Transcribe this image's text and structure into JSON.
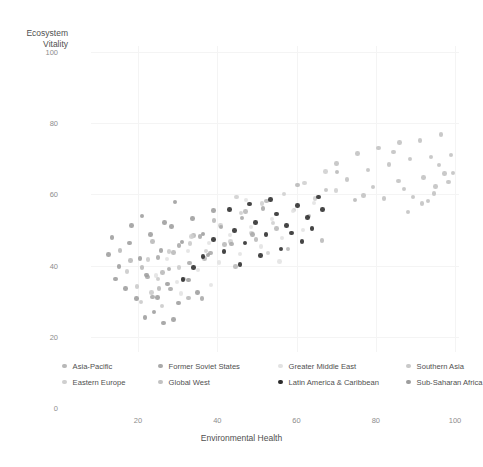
{
  "chart_data": {
    "type": "scatter",
    "title": "",
    "xlabel": "Environmental Health",
    "ylabel": "Ecosystem\nVitality",
    "ylabel_line1": "Ecosystem",
    "ylabel_line2": "Vitality",
    "xlim": [
      0,
      100
    ],
    "ylim": [
      0,
      100
    ],
    "xticks": [
      20,
      40,
      60,
      80,
      100
    ],
    "yticks": [
      0,
      20,
      40,
      60,
      80,
      100
    ],
    "grid": true,
    "legend_position": "bottom",
    "series": [
      {
        "name": "Asia-Pacific",
        "color": "#b8b8b8",
        "points": [
          [
            15.4,
            44.2
          ],
          [
            18.1,
            41.5
          ],
          [
            21.0,
            39.4
          ],
          [
            23.6,
            46.8
          ],
          [
            26.2,
            38.1
          ],
          [
            28.9,
            43.7
          ],
          [
            31.5,
            36.2
          ],
          [
            34.0,
            48.5
          ],
          [
            36.8,
            42.0
          ],
          [
            39.2,
            52.6
          ],
          [
            41.8,
            45.9
          ],
          [
            44.6,
            39.8
          ],
          [
            47.1,
            55.2
          ],
          [
            49.8,
            47.3
          ],
          [
            52.4,
            58.1
          ],
          [
            55.0,
            50.4
          ],
          [
            57.8,
            44.6
          ],
          [
            60.3,
            62.7
          ],
          [
            63.1,
            53.9
          ],
          [
            66.4,
            47.1
          ],
          [
            70.2,
            66.3
          ],
          [
            74.8,
            58.4
          ],
          [
            25.3,
            33.6
          ],
          [
            32.7,
            30.9
          ]
        ]
      },
      {
        "name": "Eastern Europe",
        "color": "#cfcfcf",
        "points": [
          [
            33.5,
            48.2
          ],
          [
            37.2,
            44.1
          ],
          [
            40.8,
            51.3
          ],
          [
            43.4,
            46.7
          ],
          [
            46.0,
            54.8
          ],
          [
            48.7,
            49.2
          ],
          [
            51.3,
            57.4
          ],
          [
            54.1,
            52.0
          ],
          [
            56.8,
            60.1
          ],
          [
            59.4,
            55.6
          ],
          [
            62.0,
            63.2
          ],
          [
            64.7,
            58.9
          ],
          [
            67.3,
            66.4
          ],
          [
            70.0,
            61.1
          ],
          [
            44.9,
            59.3
          ],
          [
            52.8,
            43.5
          ]
        ]
      },
      {
        "name": "Former Soviet States",
        "color": "#a9a9a9",
        "points": [
          [
            22.4,
            36.8
          ],
          [
            25.1,
            42.3
          ],
          [
            27.8,
            39.1
          ],
          [
            30.4,
            45.6
          ],
          [
            33.0,
            40.8
          ],
          [
            35.7,
            48.2
          ],
          [
            38.3,
            43.5
          ],
          [
            41.0,
            50.9
          ],
          [
            43.6,
            46.1
          ],
          [
            46.3,
            53.4
          ],
          [
            48.9,
            48.7
          ],
          [
            51.5,
            56.0
          ],
          [
            28.2,
            33.4
          ],
          [
            36.1,
            30.7
          ],
          [
            23.7,
            31.2
          ]
        ]
      },
      {
        "name": "Global West",
        "color": "#c2c2c2",
        "points": [
          [
            67.4,
            61.3
          ],
          [
            70.1,
            68.7
          ],
          [
            72.8,
            64.2
          ],
          [
            75.4,
            71.5
          ],
          [
            78.0,
            66.8
          ],
          [
            80.7,
            73.1
          ],
          [
            83.3,
            68.4
          ],
          [
            86.0,
            74.6
          ],
          [
            88.6,
            69.9
          ],
          [
            91.2,
            75.2
          ],
          [
            93.9,
            70.5
          ],
          [
            96.5,
            76.8
          ],
          [
            99.0,
            71.1
          ],
          [
            82.1,
            58.9
          ],
          [
            85.8,
            63.7
          ],
          [
            89.4,
            59.2
          ],
          [
            92.0,
            64.8
          ],
          [
            94.7,
            60.3
          ],
          [
            97.3,
            65.9
          ],
          [
            88.2,
            55.1
          ],
          [
            91.7,
            57.4
          ],
          [
            95.1,
            62.2
          ],
          [
            98.4,
            63.5
          ],
          [
            79.3,
            62.1
          ],
          [
            76.9,
            59.7
          ],
          [
            84.5,
            71.9
          ],
          [
            87.1,
            61.5
          ],
          [
            93.2,
            58.1
          ],
          [
            96.0,
            68.3
          ],
          [
            99.5,
            66.0
          ]
        ]
      },
      {
        "name": "Greater Middle East",
        "color": "#e2e2e2",
        "points": [
          [
            24.6,
            37.2
          ],
          [
            27.3,
            41.8
          ],
          [
            29.9,
            35.4
          ],
          [
            32.6,
            44.1
          ],
          [
            35.2,
            38.7
          ],
          [
            37.9,
            46.3
          ],
          [
            40.5,
            40.9
          ],
          [
            43.2,
            48.6
          ],
          [
            45.8,
            43.2
          ],
          [
            48.5,
            50.8
          ],
          [
            51.1,
            45.4
          ],
          [
            53.8,
            53.1
          ],
          [
            56.4,
            47.7
          ],
          [
            59.1,
            55.3
          ],
          [
            61.7,
            50.0
          ],
          [
            64.4,
            57.6
          ],
          [
            30.8,
            32.1
          ],
          [
            38.4,
            34.5
          ],
          [
            47.2,
            58.4
          ],
          [
            55.7,
            41.2
          ]
        ]
      },
      {
        "name": "Latin America & Caribbean",
        "color": "#2b2b2b",
        "points": [
          [
            36.4,
            42.6
          ],
          [
            39.0,
            47.3
          ],
          [
            41.7,
            44.0
          ],
          [
            44.3,
            49.8
          ],
          [
            47.0,
            46.4
          ],
          [
            49.6,
            52.1
          ],
          [
            52.3,
            48.8
          ],
          [
            54.9,
            54.5
          ],
          [
            57.5,
            51.2
          ],
          [
            60.2,
            56.9
          ],
          [
            62.8,
            53.5
          ],
          [
            65.5,
            59.2
          ],
          [
            43.1,
            55.7
          ],
          [
            45.7,
            40.3
          ],
          [
            50.9,
            42.9
          ],
          [
            56.1,
            44.6
          ],
          [
            58.7,
            49.2
          ],
          [
            61.4,
            46.8
          ],
          [
            34.0,
            39.5
          ],
          [
            31.3,
            36.1
          ],
          [
            63.9,
            50.4
          ],
          [
            66.6,
            55.8
          ],
          [
            48.2,
            57.3
          ],
          [
            53.4,
            58.6
          ]
        ]
      },
      {
        "name": "Southern Asia",
        "color": "#c9c9c9",
        "points": [
          [
            17.2,
            38.4
          ],
          [
            19.8,
            34.1
          ],
          [
            22.5,
            41.7
          ],
          [
            25.1,
            36.3
          ],
          [
            27.8,
            43.9
          ],
          [
            30.4,
            39.5
          ],
          [
            33.1,
            46.2
          ],
          [
            20.7,
            29.8
          ],
          [
            23.4,
            32.5
          ],
          [
            26.0,
            28.7
          ]
        ]
      },
      {
        "name": "Sub-Saharan Africa",
        "color": "#9d9d9d",
        "points": [
          [
            12.6,
            43.1
          ],
          [
            15.2,
            39.8
          ],
          [
            17.9,
            46.4
          ],
          [
            20.5,
            42.0
          ],
          [
            23.2,
            48.7
          ],
          [
            25.8,
            44.3
          ],
          [
            28.5,
            51.0
          ],
          [
            31.1,
            46.6
          ],
          [
            33.8,
            53.2
          ],
          [
            36.4,
            48.9
          ],
          [
            39.1,
            55.5
          ],
          [
            14.3,
            36.2
          ],
          [
            16.9,
            33.5
          ],
          [
            19.6,
            30.8
          ],
          [
            22.2,
            37.4
          ],
          [
            24.9,
            31.1
          ],
          [
            27.5,
            34.8
          ],
          [
            30.2,
            29.5
          ],
          [
            32.8,
            36.0
          ],
          [
            18.4,
            51.3
          ],
          [
            21.0,
            54.0
          ],
          [
            26.7,
            52.1
          ],
          [
            29.3,
            57.8
          ],
          [
            35.0,
            32.4
          ],
          [
            37.7,
            43.0
          ],
          [
            13.5,
            47.9
          ],
          [
            24.1,
            26.9
          ],
          [
            21.8,
            25.4
          ],
          [
            29.0,
            24.8
          ],
          [
            26.4,
            23.9
          ]
        ]
      }
    ]
  },
  "legend": {
    "items": [
      {
        "label": "Asia-Pacific",
        "color": "#b8b8b8"
      },
      {
        "label": "Former Soviet States",
        "color": "#a9a9a9"
      },
      {
        "label": "Greater Middle East",
        "color": "#e2e2e2"
      },
      {
        "label": "Southern Asia",
        "color": "#c9c9c9"
      },
      {
        "label": "Eastern Europe",
        "color": "#cfcfcf"
      },
      {
        "label": "Global West",
        "color": "#c2c2c2"
      },
      {
        "label": "Latin America & Caribbean",
        "color": "#2b2b2b"
      },
      {
        "label": "Sub-Saharan Africa",
        "color": "#9d9d9d"
      }
    ]
  },
  "axes": {
    "y_title_line1": "Ecosystem",
    "y_title_line2": "Vitality",
    "x_title": "Environmental Health",
    "y_tick_labels": [
      "100",
      "80",
      "60",
      "40",
      "20",
      "0"
    ],
    "x_tick_labels": [
      "20",
      "40",
      "60",
      "80",
      "100"
    ]
  }
}
